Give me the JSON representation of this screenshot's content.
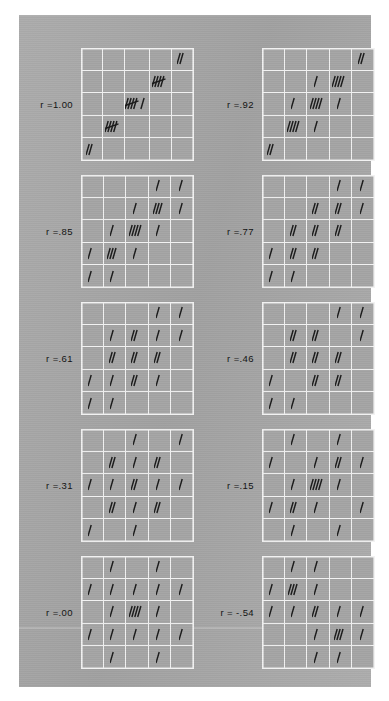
{
  "figure": {
    "title": "",
    "plate_color": "#a8a8a8",
    "grid_line_color": "#f2f2f2",
    "mark_color": "#1a1a1a"
  },
  "chart_data": {
    "type": "heatmap",
    "title": "",
    "subtitle": "",
    "xlabel": "",
    "ylabel": "",
    "grid": true,
    "legend_position": "none",
    "rows": 5,
    "columns": 5,
    "panels": [
      {
        "label": "r =1.00",
        "r": 1.0,
        "counts": [
          [
            0,
            0,
            0,
            0,
            2
          ],
          [
            0,
            0,
            0,
            5,
            0
          ],
          [
            0,
            0,
            6,
            0,
            0
          ],
          [
            0,
            5,
            0,
            0,
            0
          ],
          [
            2,
            0,
            0,
            0,
            0
          ]
        ]
      },
      {
        "label": "r =.92",
        "r": 0.92,
        "counts": [
          [
            0,
            0,
            0,
            0,
            2
          ],
          [
            0,
            0,
            1,
            4,
            0
          ],
          [
            0,
            1,
            4,
            1,
            0
          ],
          [
            0,
            4,
            1,
            0,
            0
          ],
          [
            2,
            0,
            0,
            0,
            0
          ]
        ]
      },
      {
        "label": "r =.85",
        "r": 0.85,
        "counts": [
          [
            0,
            0,
            0,
            1,
            1
          ],
          [
            0,
            0,
            1,
            3,
            1
          ],
          [
            0,
            1,
            4,
            1,
            0
          ],
          [
            1,
            3,
            1,
            0,
            0
          ],
          [
            1,
            1,
            0,
            0,
            0
          ]
        ]
      },
      {
        "label": "r =.77",
        "r": 0.77,
        "counts": [
          [
            0,
            0,
            0,
            1,
            1
          ],
          [
            0,
            0,
            2,
            2,
            1
          ],
          [
            0,
            2,
            2,
            2,
            0
          ],
          [
            1,
            2,
            2,
            0,
            0
          ],
          [
            1,
            1,
            0,
            0,
            0
          ]
        ]
      },
      {
        "label": "r =.61",
        "r": 0.61,
        "counts": [
          [
            0,
            0,
            0,
            1,
            1
          ],
          [
            0,
            1,
            2,
            1,
            1
          ],
          [
            0,
            2,
            2,
            2,
            0
          ],
          [
            1,
            1,
            2,
            1,
            0
          ],
          [
            1,
            1,
            0,
            0,
            0
          ]
        ]
      },
      {
        "label": "r =.46",
        "r": 0.46,
        "counts": [
          [
            0,
            0,
            0,
            1,
            1
          ],
          [
            0,
            2,
            2,
            0,
            1
          ],
          [
            0,
            2,
            2,
            2,
            0
          ],
          [
            1,
            0,
            2,
            2,
            0
          ],
          [
            1,
            1,
            0,
            0,
            0
          ]
        ]
      },
      {
        "label": "r =.31",
        "r": 0.31,
        "counts": [
          [
            0,
            0,
            1,
            0,
            1
          ],
          [
            0,
            2,
            1,
            2,
            0
          ],
          [
            1,
            1,
            2,
            1,
            1
          ],
          [
            0,
            2,
            1,
            2,
            0
          ],
          [
            1,
            0,
            1,
            0,
            0
          ]
        ]
      },
      {
        "label": "r =.15",
        "r": 0.15,
        "counts": [
          [
            0,
            1,
            0,
            1,
            0
          ],
          [
            1,
            0,
            1,
            2,
            1
          ],
          [
            0,
            1,
            4,
            1,
            0
          ],
          [
            1,
            2,
            1,
            0,
            1
          ],
          [
            0,
            1,
            0,
            1,
            0
          ]
        ]
      },
      {
        "label": "r =.00",
        "r": 0.0,
        "counts": [
          [
            0,
            1,
            0,
            1,
            0
          ],
          [
            1,
            1,
            1,
            1,
            1
          ],
          [
            0,
            1,
            4,
            1,
            0
          ],
          [
            1,
            1,
            1,
            1,
            1
          ],
          [
            0,
            1,
            0,
            1,
            0
          ]
        ]
      },
      {
        "label": "r = -.54",
        "r": -0.54,
        "counts": [
          [
            0,
            1,
            1,
            0,
            0
          ],
          [
            1,
            3,
            1,
            0,
            0
          ],
          [
            1,
            1,
            2,
            1,
            1
          ],
          [
            0,
            0,
            1,
            3,
            1
          ],
          [
            0,
            0,
            1,
            1,
            0
          ]
        ]
      }
    ]
  }
}
